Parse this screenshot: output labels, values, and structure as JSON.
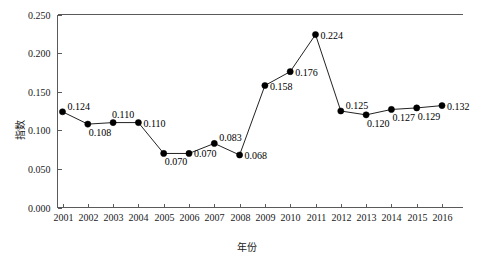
{
  "chart_data": {
    "type": "line",
    "title": "",
    "xlabel": "年份",
    "ylabel": "指数",
    "categories": [
      "2001",
      "2002",
      "2003",
      "2004",
      "2005",
      "2006",
      "2007",
      "2008",
      "2009",
      "2010",
      "2011",
      "2012",
      "2013",
      "2014",
      "2015",
      "2016"
    ],
    "values": [
      0.124,
      0.108,
      0.11,
      0.11,
      0.07,
      0.07,
      0.083,
      0.068,
      0.158,
      0.176,
      0.224,
      0.125,
      0.12,
      0.127,
      0.129,
      0.132
    ],
    "point_labels": [
      "0.124",
      "0.108",
      "0.110",
      "0.110",
      "0.070",
      "0.070",
      "0.083",
      "0.068",
      "0.158",
      "0.176",
      "0.224",
      "0.125",
      "0.120",
      "0.127",
      "0.129",
      "0.132"
    ],
    "label_positions": [
      "right-up",
      "below-right",
      "above-right",
      "right",
      "below-right",
      "right",
      "right-up",
      "right",
      "right",
      "right",
      "right",
      "right-up",
      "below-right",
      "below-right",
      "below-right",
      "right"
    ],
    "ylim": [
      0.0,
      0.25
    ],
    "yticks": [
      0.0,
      0.05,
      0.1,
      0.15,
      0.2,
      0.25
    ],
    "ytick_labels": [
      "0.000",
      "0.050",
      "0.100",
      "0.150",
      "0.200",
      "0.250"
    ],
    "grid": false,
    "legend": "none",
    "marker": "filled-circle",
    "line_color": "#222222",
    "marker_color": "#000000",
    "axis_color": "#5a5a5a",
    "background": "#ffffff"
  }
}
